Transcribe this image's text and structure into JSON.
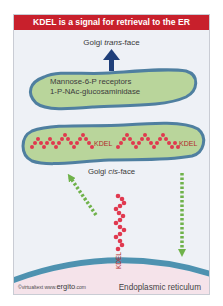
{
  "title": "KDEL is a signal for retrieval to the ER",
  "labels": {
    "trans_prefix": "Golgi ",
    "trans_italic": "trans",
    "trans_suffix": "-face",
    "cis_prefix": "Golgi ",
    "cis_italic": "cis",
    "cis_suffix": "-face",
    "er": "Endoplasmic reticulum"
  },
  "upper_cisterna": {
    "lines": [
      "Mannose-6-P  receptors",
      "1-P-NAc-glucosaminidase"
    ]
  },
  "lower_cisterna": {
    "tags": [
      "KDEL",
      "KDEL"
    ]
  },
  "free_protein": {
    "tag": "KDEL"
  },
  "credit": {
    "prefix": "©virtualtext www.",
    "brand": "ergito",
    "suffix": ".com"
  },
  "colors": {
    "title_bg": "#c8202c",
    "cisterna_fill": "#b9d59b",
    "cisterna_border": "#4f7fa0",
    "protein_beads": "#e0394f",
    "arrow_up": "#1f3f7a",
    "transport_arrows": "#6fb24a",
    "er_membrane": "#4e92b0",
    "er_lumen": "#f5e3ea"
  }
}
